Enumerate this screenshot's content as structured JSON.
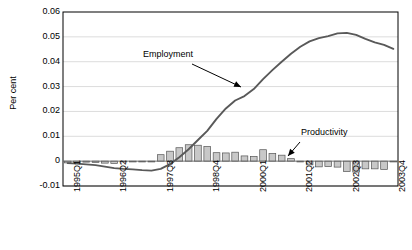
{
  "chart_data": {
    "type": "bar",
    "title": "",
    "subtitle": "",
    "xlabel": "",
    "ylabel": "Per cent",
    "ylim": [
      -0.01,
      0.06
    ],
    "yticks": [
      -0.01,
      0,
      0.01,
      0.02,
      0.03,
      0.04,
      0.05,
      0.06
    ],
    "ytick_labels": [
      "-0.01",
      "0",
      "0.01",
      "0.02",
      "0.03",
      "0.04",
      "0.05",
      "0.06"
    ],
    "grid": true,
    "grid_axis": "y",
    "legend": "none",
    "x": [
      "1995Q1",
      "1995Q2",
      "1995Q3",
      "1995Q4",
      "1996Q1",
      "1996Q2",
      "1996Q3",
      "1996Q4",
      "1997Q1",
      "1997Q2",
      "1997Q3",
      "1997Q4",
      "1998Q1",
      "1998Q2",
      "1998Q3",
      "1998Q4",
      "1999Q1",
      "1999Q2",
      "1999Q3",
      "1999Q4",
      "2000Q1",
      "2000Q2",
      "2000Q3",
      "2000Q4",
      "2001Q1",
      "2001Q2",
      "2001Q3",
      "2001Q4",
      "2002Q1",
      "2002Q2",
      "2002Q3",
      "2002Q4",
      "2003Q1",
      "2003Q2",
      "2003Q3",
      "2003Q4"
    ],
    "xtick_labels": [
      "1995Q1",
      "1996Q2",
      "1997Q3",
      "1998Q4",
      "2000Q1",
      "2001Q2",
      "2002Q3",
      "2003Q4"
    ],
    "xtick_indices": [
      0,
      5,
      10,
      15,
      20,
      25,
      30,
      35
    ],
    "series": [
      {
        "name": "Productivity",
        "type": "bar",
        "color": "#c8c8c8",
        "edgecolor": "#555555",
        "values": [
          -0.0007,
          -0.0006,
          -0.0004,
          -0.0005,
          -0.0008,
          -0.0009,
          -0.0003,
          -0.0002,
          -0.0002,
          -0.0003,
          0.0026,
          0.004,
          0.0054,
          0.0066,
          0.0064,
          0.0059,
          0.0034,
          0.0033,
          0.0036,
          0.0021,
          0.0019,
          0.0046,
          0.0031,
          0.0024,
          0.001,
          -0.0003,
          -0.0015,
          -0.0023,
          -0.0022,
          -0.0024,
          -0.0042,
          -0.0044,
          -0.0031,
          -0.0031,
          -0.0033,
          -0.0003
        ]
      },
      {
        "name": "Employment",
        "type": "line",
        "color": "#595959",
        "values": [
          -0.0008,
          -0.001,
          -0.0013,
          -0.0016,
          -0.0022,
          -0.0028,
          -0.0031,
          -0.0033,
          -0.0036,
          -0.0038,
          -0.0031,
          -0.0012,
          0.0016,
          0.0048,
          0.0085,
          0.0122,
          0.017,
          0.0212,
          0.0244,
          0.0262,
          0.029,
          0.033,
          0.0366,
          0.04,
          0.0432,
          0.046,
          0.0482,
          0.0495,
          0.0503,
          0.0514,
          0.0516,
          0.0508,
          0.0492,
          0.0478,
          0.0468,
          0.0452
        ]
      }
    ],
    "annotations": [
      {
        "text": "Employment",
        "label_x": 143,
        "label_y": 49,
        "arrow_from_x": 192,
        "arrow_from_y": 64,
        "arrow_to_x": 241,
        "arrow_to_y": 87
      },
      {
        "text": "Productivity",
        "label_x": 301,
        "label_y": 127,
        "arrow_from_x": 300,
        "arrow_from_y": 142,
        "arrow_to_x": 288,
        "arrow_to_y": 156
      }
    ]
  },
  "figure": {
    "background_color": "#ffffff",
    "plot_left": 63,
    "plot_right": 398,
    "plot_top": 12,
    "plot_bottom": 186,
    "axis_color": "#000000",
    "grid_color": "#dcdcdc"
  }
}
